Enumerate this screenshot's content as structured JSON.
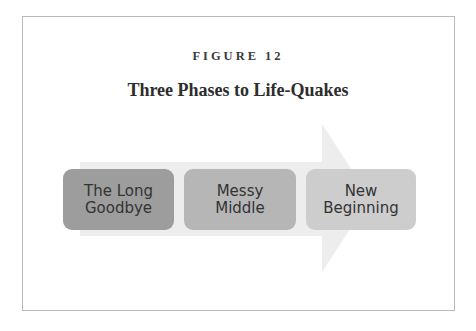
{
  "figure": {
    "label": "FIGURE 12",
    "title": "Three Phases to Life-Quakes"
  },
  "phases": [
    {
      "label": "The Long\nGoodbye",
      "color": "#9d9d9d"
    },
    {
      "label": "Messy\nMiddle",
      "color": "#b6b6b6"
    },
    {
      "label": "New\nBeginning",
      "color": "#cdcdcd"
    }
  ],
  "colors": {
    "arrow": "#ececec",
    "frame_border": "#b9b9b9"
  }
}
